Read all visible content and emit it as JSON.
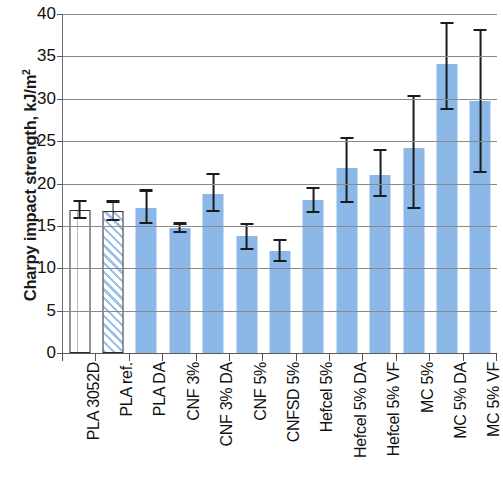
{
  "chart_data": {
    "type": "bar",
    "title": "",
    "xlabel": "",
    "ylabel": "Charpy impact strength, kJ/m",
    "ylabel_sup": "2",
    "ylim": [
      0,
      40
    ],
    "yticks": [
      0,
      5,
      10,
      15,
      20,
      25,
      30,
      35,
      40
    ],
    "ytick_labels": [
      "0",
      "5",
      "10",
      "15",
      "20",
      "25",
      "30",
      "35",
      "40"
    ],
    "grid": "horizontal",
    "legend": "none",
    "categories": [
      "PLA 3052D",
      "PLA ref.",
      "PLA DA",
      "CNF 3%",
      "CNF 3% DA",
      "CNF 5%",
      "CNFSD 5%",
      "Hefcel 5%",
      "Hefcel 5% DA",
      "Hefcel 5% VF",
      "MC 5%",
      "MC 5% DA",
      "MC 5% VF"
    ],
    "values": [
      16.9,
      16.8,
      17.1,
      14.8,
      18.8,
      13.8,
      12.0,
      18.0,
      21.8,
      21.0,
      24.2,
      34.1,
      29.7
    ],
    "err_low": [
      15.8,
      15.6,
      15.2,
      14.2,
      16.6,
      12.2,
      10.7,
      16.5,
      17.7,
      18.4,
      17.0,
      28.7,
      21.2
    ],
    "err_high": [
      18.1,
      18.0,
      19.3,
      15.4,
      21.2,
      15.3,
      13.5,
      19.6,
      25.5,
      24.1,
      30.4,
      39.1,
      38.2
    ],
    "bar_styles": [
      "dotted",
      "hatch",
      "solid",
      "solid",
      "solid",
      "solid",
      "solid",
      "solid",
      "solid",
      "solid",
      "solid",
      "solid",
      "solid"
    ],
    "colors": {
      "bar_fill": "#8cb8e8",
      "bar_outline": "#2b2b2b",
      "error_bar": "#1b1b1b",
      "gridline": "#8a8a8a",
      "axis": "#5a5a5a",
      "text": "#111111"
    }
  }
}
